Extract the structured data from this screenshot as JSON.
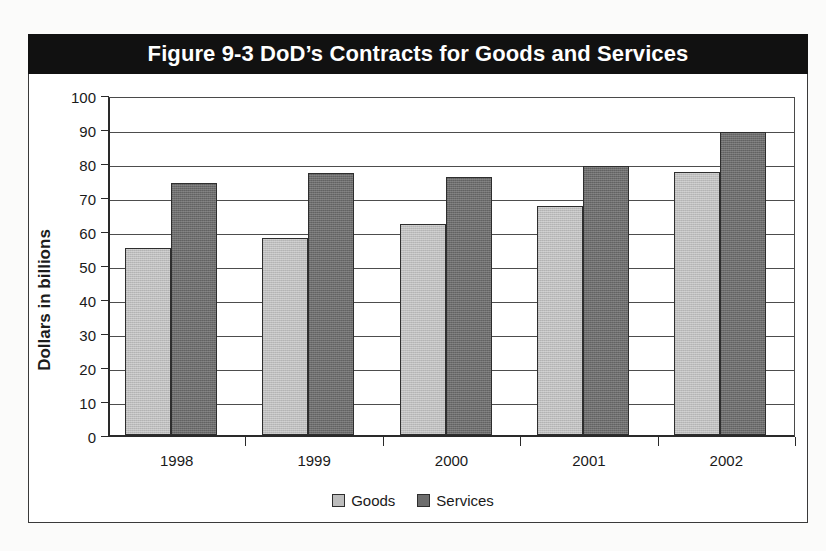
{
  "figure": {
    "title": "Figure 9-3  DoD’s Contracts for Goods and Services"
  },
  "chart_data": {
    "type": "bar",
    "title": "Figure 9-3  DoD’s Contracts for Goods and Services",
    "xlabel": "",
    "ylabel": "Dollars in billions",
    "categories": [
      "1998",
      "1999",
      "2000",
      "2001",
      "2002"
    ],
    "series": [
      {
        "name": "Goods",
        "color": "#bdbdbd",
        "values": [
          55,
          58,
          62,
          67.5,
          77.5
        ]
      },
      {
        "name": "Services",
        "color": "#6d6d6d",
        "values": [
          74,
          77,
          76,
          79,
          89
        ]
      }
    ],
    "ylim": [
      0,
      100
    ],
    "yticks": [
      "0",
      "10",
      "20",
      "30",
      "40",
      "50",
      "60",
      "70",
      "80",
      "90",
      "100"
    ],
    "grid": true,
    "legend_position": "bottom"
  },
  "legend": {
    "items": [
      {
        "label": "Goods"
      },
      {
        "label": "Services"
      }
    ]
  }
}
